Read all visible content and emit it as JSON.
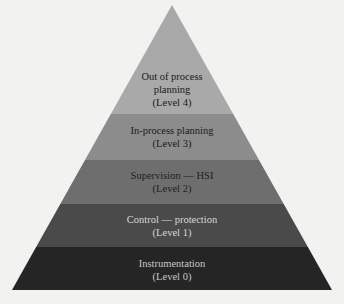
{
  "diagram": {
    "type": "pyramid",
    "levels": [
      {
        "title_lines": [
          "Out of process",
          "planning"
        ],
        "level_label": "(Level 4)",
        "fill": "#a9a9a9",
        "text_color": "#1a1a1a"
      },
      {
        "title_lines": [
          "In-process planning"
        ],
        "level_label": "(Level 3)",
        "fill": "#8c8c8c",
        "text_color": "#1a1a1a"
      },
      {
        "title_lines": [
          "Supervision — HSI"
        ],
        "level_label": "(Level 2)",
        "fill": "#6e6e6e",
        "text_color": "#1e1e1e"
      },
      {
        "title_lines": [
          "Control — protection"
        ],
        "level_label": "(Level 1)",
        "fill": "#4a4a4a",
        "text_color": "#d8d8d8"
      },
      {
        "title_lines": [
          "Instrumentation"
        ],
        "level_label": "(Level 0)",
        "fill": "#252525",
        "text_color": "#c8c8c8"
      }
    ]
  }
}
